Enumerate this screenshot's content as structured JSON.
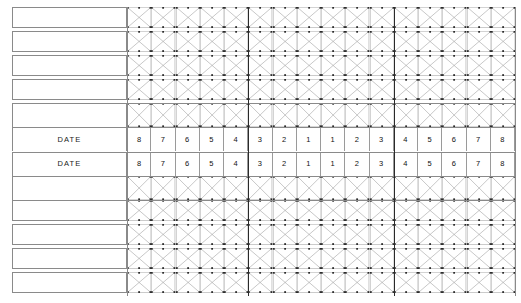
{
  "sheet": {
    "title": "Sample / specimen tabulation form",
    "label_column_header": "",
    "column_labels": [
      "8",
      "7",
      "6",
      "5",
      "4",
      "3",
      "2",
      "1",
      "1",
      "2",
      "3",
      "4",
      "5",
      "6",
      "7",
      "8"
    ],
    "group_divider_after_columns": [
      5,
      11
    ],
    "colors": {
      "rule": "#8a8a8a",
      "thick_rule": "#2a2a2a",
      "hatch": "#9b9b9b",
      "node": "#2b2b2b",
      "text": "#111111",
      "paper": "#ffffff"
    },
    "rows": [
      {
        "label": "",
        "type": "hatched",
        "joined": false
      },
      {
        "label": "",
        "type": "hatched",
        "joined": false
      },
      {
        "label": "",
        "type": "hatched",
        "joined": false
      },
      {
        "label": "",
        "type": "hatched",
        "joined": false
      },
      {
        "label": "",
        "type": "hatched",
        "joined": true
      },
      {
        "label": "DATE",
        "type": "numbered",
        "joined": true
      },
      {
        "label": "DATE",
        "type": "numbered",
        "joined": true
      },
      {
        "label": "",
        "type": "hatched",
        "joined": true
      },
      {
        "label": "",
        "type": "hatched",
        "joined": false
      },
      {
        "label": "",
        "type": "hatched",
        "joined": false
      },
      {
        "label": "",
        "type": "hatched",
        "joined": false
      },
      {
        "label": "",
        "type": "hatched",
        "joined": false
      }
    ],
    "numbered_rows": [
      {
        "label": "DATE",
        "values": [
          "8",
          "7",
          "6",
          "5",
          "4",
          "3",
          "2",
          "1",
          "1",
          "2",
          "3",
          "4",
          "5",
          "6",
          "7",
          "8"
        ]
      },
      {
        "label": "DATE",
        "values": [
          "8",
          "7",
          "6",
          "5",
          "4",
          "3",
          "2",
          "1",
          "1",
          "2",
          "3",
          "4",
          "5",
          "6",
          "7",
          "8"
        ]
      }
    ],
    "geometry": {
      "label_left": 12,
      "label_right": 127,
      "grid_left": 127,
      "grid_right": 515,
      "columns": 16,
      "rows_total": 12,
      "top": 7,
      "bottom": 296
    }
  }
}
